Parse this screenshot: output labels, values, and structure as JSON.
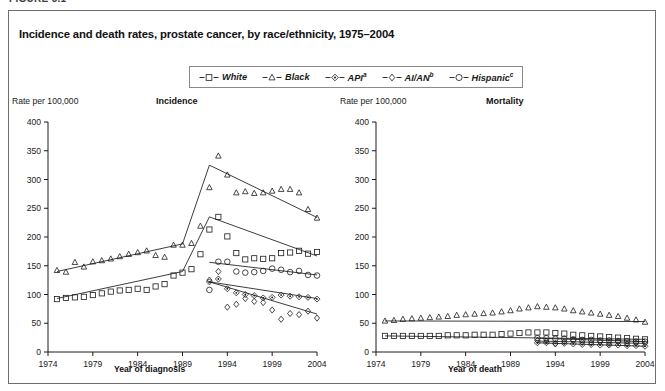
{
  "figure": {
    "number_label": "FIGURE 3.1",
    "title": "Incidence and death rates, prostate cancer, by race/ethnicity, 1975–2004"
  },
  "legend": {
    "position": "top-center",
    "entries": [
      {
        "label": "White",
        "sup": "",
        "marker": "square",
        "icon": "legend-marker-square"
      },
      {
        "label": "Black",
        "sup": "",
        "marker": "triangle",
        "icon": "legend-marker-triangle"
      },
      {
        "label": "API",
        "sup": "a",
        "marker": "diamond-dot",
        "icon": "legend-marker-diamond-dot"
      },
      {
        "label": "AI/AN",
        "sup": "b",
        "marker": "small-diamond",
        "icon": "legend-marker-small-diamond"
      },
      {
        "label": "Hispanic",
        "sup": "c",
        "marker": "circle",
        "icon": "legend-marker-circle"
      }
    ]
  },
  "chart_data": [
    {
      "type": "scatter",
      "panel": "incidence",
      "title": "Incidence",
      "ylabel": "Rate per 100,000",
      "xlabel": "Year of diagnosis",
      "ylim": [
        0,
        400
      ],
      "yticks": [
        0,
        50,
        100,
        150,
        200,
        250,
        300,
        350,
        400
      ],
      "ytick_labels": [
        "0",
        "50",
        "100",
        "150",
        "200",
        "250",
        "300",
        "350",
        "400"
      ],
      "xlim": [
        1974,
        2004
      ],
      "xticks": [
        1974,
        1979,
        1984,
        1989,
        1994,
        1999,
        2004
      ],
      "xtick_labels": [
        "1974",
        "1979",
        "1984",
        "1989",
        "1994",
        "1999",
        "2004"
      ],
      "grid": false,
      "series": [
        {
          "name": "White",
          "marker": "square",
          "x": [
            1975,
            1976,
            1977,
            1978,
            1979,
            1980,
            1981,
            1982,
            1983,
            1984,
            1985,
            1986,
            1987,
            1988,
            1989,
            1990,
            1991,
            1992,
            1993,
            1994,
            1995,
            1996,
            1997,
            1998,
            1999,
            2000,
            2001,
            2002,
            2003,
            2004
          ],
          "values": [
            92,
            94,
            95,
            96,
            99,
            102,
            105,
            107,
            108,
            110,
            108,
            114,
            118,
            133,
            138,
            144,
            170,
            213,
            235,
            201,
            172,
            161,
            163,
            162,
            163,
            172,
            173,
            176,
            171,
            174
          ],
          "trend_x": [
            1975,
            1989,
            1992,
            2004
          ],
          "trend_y": [
            93,
            140,
            235,
            167
          ]
        },
        {
          "name": "Black",
          "marker": "triangle",
          "x": [
            1975,
            1976,
            1977,
            1978,
            1979,
            1980,
            1981,
            1982,
            1983,
            1984,
            1985,
            1986,
            1987,
            1988,
            1989,
            1990,
            1991,
            1992,
            1993,
            1994,
            1995,
            1996,
            1997,
            1998,
            1999,
            2000,
            2001,
            2002,
            2003,
            2004
          ],
          "values": [
            142,
            139,
            156,
            148,
            157,
            159,
            162,
            166,
            170,
            173,
            176,
            168,
            165,
            186,
            186,
            189,
            219,
            286,
            341,
            308,
            277,
            279,
            276,
            277,
            280,
            283,
            283,
            277,
            248,
            233
          ],
          "trend_x": [
            1975,
            1989,
            1992,
            2004
          ],
          "trend_y": [
            140,
            188,
            325,
            234
          ]
        },
        {
          "name": "API",
          "marker": "diamond-dot",
          "x": [
            1992,
            1993,
            1994,
            1995,
            1996,
            1997,
            1998,
            1999,
            2000,
            2001,
            2002,
            2003,
            2004
          ],
          "values": [
            122,
            127,
            110,
            103,
            100,
            98,
            94,
            95,
            99,
            97,
            96,
            95,
            92
          ],
          "trend_x": [
            1992,
            2004
          ],
          "trend_y": [
            122,
            93
          ]
        },
        {
          "name": "AI/AN",
          "marker": "small-diamond",
          "x": [
            1992,
            1993,
            1994,
            1995,
            1996,
            1997,
            1998,
            1999,
            2000,
            2001,
            2002,
            2003,
            2004
          ],
          "values": [
            125,
            140,
            78,
            83,
            93,
            88,
            86,
            73,
            57,
            67,
            65,
            71,
            59
          ],
          "trend_x": [
            1992,
            2004
          ],
          "trend_y": [
            122,
            66
          ]
        },
        {
          "name": "Hispanic",
          "marker": "circle",
          "x": [
            1992,
            1993,
            1994,
            1995,
            1996,
            1997,
            1998,
            1999,
            2000,
            2001,
            2002,
            2003,
            2004
          ],
          "values": [
            108,
            157,
            157,
            140,
            138,
            139,
            141,
            145,
            143,
            139,
            141,
            134,
            133
          ],
          "trend_x": [
            1992,
            2004
          ],
          "trend_y": [
            156,
            134
          ]
        }
      ]
    },
    {
      "type": "scatter",
      "panel": "mortality",
      "title": "Mortality",
      "ylabel": "Rate per 100,000",
      "xlabel": "Year of death",
      "ylim": [
        0,
        400
      ],
      "yticks": [
        0,
        50,
        100,
        150,
        200,
        250,
        300,
        350,
        400
      ],
      "ytick_labels": [
        "0",
        "50",
        "100",
        "150",
        "200",
        "250",
        "300",
        "350",
        "400"
      ],
      "xlim": [
        1974,
        2004
      ],
      "xticks": [
        1974,
        1979,
        1984,
        1989,
        1994,
        1999,
        2004
      ],
      "xtick_labels": [
        "1974",
        "1979",
        "1984",
        "1989",
        "1994",
        "1999",
        "2004"
      ],
      "grid": false,
      "series": [
        {
          "name": "White",
          "marker": "square",
          "x": [
            1975,
            1976,
            1977,
            1978,
            1979,
            1980,
            1981,
            1982,
            1983,
            1984,
            1985,
            1986,
            1987,
            1988,
            1989,
            1990,
            1991,
            1992,
            1993,
            1994,
            1995,
            1996,
            1997,
            1998,
            1999,
            2000,
            2001,
            2002,
            2003,
            2004
          ],
          "values": [
            28,
            28,
            28,
            28,
            28,
            28,
            28,
            29,
            29,
            29,
            30,
            30,
            30,
            31,
            32,
            33,
            34,
            34,
            34,
            33,
            32,
            30,
            29,
            28,
            27,
            26,
            25,
            24,
            23,
            22
          ],
          "trend_x": [
            1975,
            2004
          ],
          "trend_y": [
            28,
            22
          ]
        },
        {
          "name": "Black",
          "marker": "triangle",
          "x": [
            1975,
            1976,
            1977,
            1978,
            1979,
            1980,
            1981,
            1982,
            1983,
            1984,
            1985,
            1986,
            1987,
            1988,
            1989,
            1990,
            1991,
            1992,
            1993,
            1994,
            1995,
            1996,
            1997,
            1998,
            1999,
            2000,
            2001,
            2002,
            2003,
            2004
          ],
          "values": [
            54,
            55,
            57,
            58,
            59,
            60,
            61,
            62,
            64,
            65,
            66,
            67,
            68,
            70,
            72,
            75,
            77,
            79,
            78,
            77,
            75,
            72,
            70,
            68,
            66,
            64,
            62,
            59,
            56,
            52
          ],
          "trend_x": [
            1975,
            2004
          ],
          "trend_y": [
            54,
            53
          ]
        },
        {
          "name": "API",
          "marker": "diamond-dot",
          "x": [
            1992,
            1993,
            1994,
            1995,
            1996,
            1997,
            1998,
            1999,
            2000,
            2001,
            2002,
            2003,
            2004
          ],
          "values": [
            16,
            16,
            15,
            15,
            14,
            13,
            13,
            12,
            12,
            12,
            11,
            11,
            10
          ],
          "trend_x": [
            1992,
            2004
          ],
          "trend_y": [
            16,
            10
          ]
        },
        {
          "name": "AI/AN",
          "marker": "small-diamond",
          "x": [
            1992,
            1993,
            1994,
            1995,
            1996,
            1997,
            1998,
            1999,
            2000,
            2001,
            2002,
            2003,
            2004
          ],
          "values": [
            20,
            19,
            14,
            18,
            20,
            17,
            16,
            17,
            15,
            18,
            14,
            16,
            15
          ],
          "trend_x": [
            1992,
            2004
          ],
          "trend_y": [
            19,
            15
          ]
        },
        {
          "name": "Hispanic",
          "marker": "circle",
          "x": [
            1992,
            1993,
            1994,
            1995,
            1996,
            1997,
            1998,
            1999,
            2000,
            2001,
            2002,
            2003,
            2004
          ],
          "values": [
            24,
            24,
            23,
            23,
            22,
            21,
            21,
            20,
            20,
            19,
            19,
            18,
            18
          ],
          "trend_x": [
            1992,
            2004
          ],
          "trend_y": [
            24,
            18
          ]
        }
      ]
    }
  ]
}
